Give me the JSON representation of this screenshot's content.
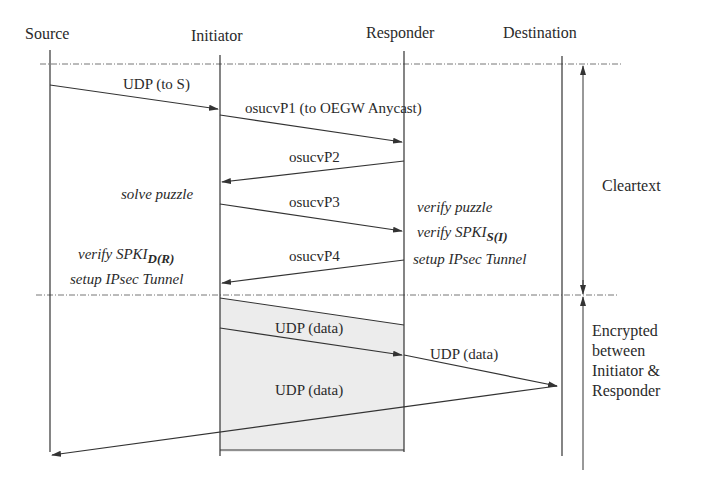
{
  "participants": [
    {
      "name": "Source"
    },
    {
      "name": "Initiator"
    },
    {
      "name": "Responder"
    },
    {
      "name": "Destination"
    }
  ],
  "messages": [
    {
      "label": "UDP (to S)",
      "from": "Source",
      "to": "Initiator"
    },
    {
      "label": "osucvP1 (to OEGW Anycast)",
      "from": "Initiator",
      "to": "Responder"
    },
    {
      "label": "osucvP2",
      "from": "Responder",
      "to": "Initiator"
    },
    {
      "label": "osucvP3",
      "from": "Initiator",
      "to": "Responder"
    },
    {
      "label": "osucvP4",
      "from": "Responder",
      "to": "Initiator"
    },
    {
      "label": "UDP (data)",
      "from": "Initiator",
      "to": "Responder",
      "encrypted": true
    },
    {
      "label": "UDP (data)",
      "from": "Responder",
      "to": "Destination"
    },
    {
      "label": "UDP (data)",
      "from": "Destination",
      "to": "Source"
    }
  ],
  "annotations": {
    "initiator_solve": "solve puzzle",
    "initiator_verify_prefix": "verify SPKI",
    "initiator_verify_sub": "D(R)",
    "initiator_setup": "setup IPsec Tunnel",
    "responder_verify_puzzle": "verify puzzle",
    "responder_verify_prefix": "verify SPKI",
    "responder_verify_sub": "S(I)",
    "responder_setup": "setup IPsec Tunnel"
  },
  "phases": [
    {
      "label": "Cleartext"
    },
    {
      "label_lines": [
        "Encrypted",
        "between",
        "Initiator &",
        "Responder"
      ]
    }
  ],
  "colors": {
    "line": "#333333",
    "dashed": "#777777",
    "tunnel_fill": "#ececec"
  }
}
